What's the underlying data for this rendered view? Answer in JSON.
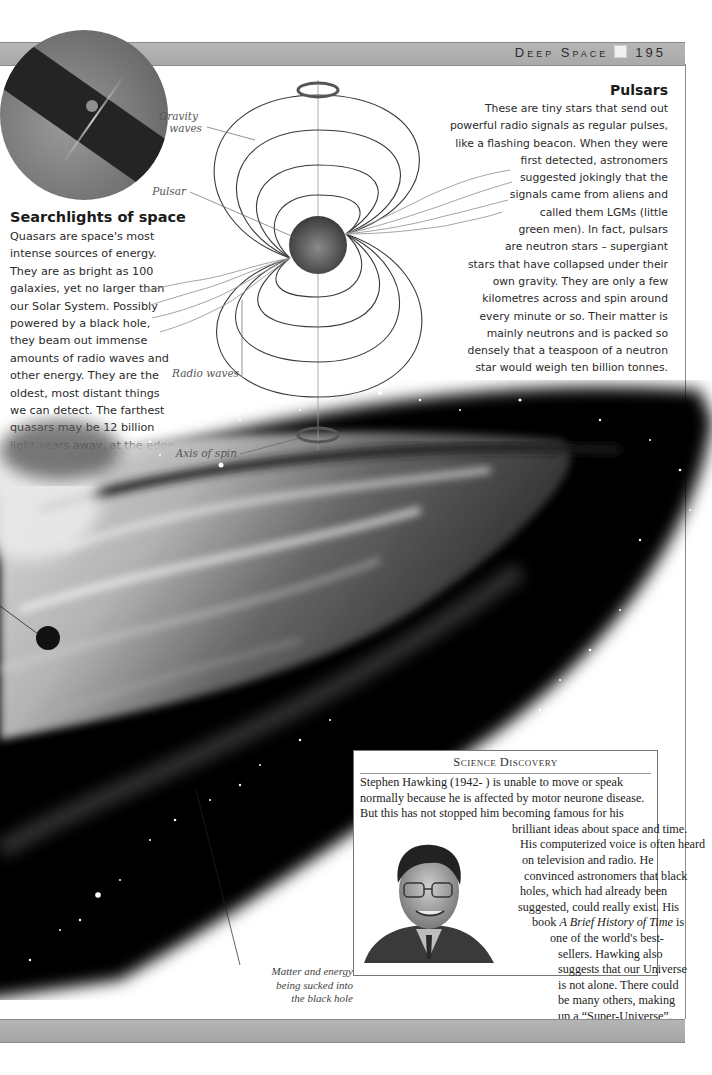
{
  "header": {
    "section": "Deep Space",
    "page_number": "195",
    "page_icon": "square-page-icon"
  },
  "searchlights": {
    "title": "Searchlights of space",
    "body_lines": [
      "Quasars are space's most",
      "intense sources of energy.",
      "They are as bright as 100",
      "galaxies, yet no larger than",
      "our Solar System. Possibly",
      "powered by a black hole,",
      "they beam out immense",
      "amounts of radio waves and",
      "other energy. They are the",
      "oldest, most distant things",
      "we can detect. The farthest",
      "quasars may be 12 billion",
      "light-years away, at the edge",
      "of space, time and the",
      "Universe."
    ]
  },
  "pulsars": {
    "title": "Pulsars",
    "body_lines": [
      "These are tiny stars that send out",
      "powerful radio signals as regular pulses,",
      "like a flashing beacon. When they were",
      "first detected, astronomers",
      "suggested jokingly that the",
      "signals came from aliens and",
      "called them LGMs (little",
      "green men). In fact, pulsars",
      "are neutron stars – supergiant",
      "stars that have collapsed under their",
      "own gravity. They are only a few",
      "kilometres across and spin around",
      "every minute or so. Their matter is",
      "mainly neutrons and is packed so",
      "densely that a teaspoon of a neutron",
      "star would weigh ten billion tonnes."
    ]
  },
  "diagram": {
    "labels": {
      "gravity_waves_1": "Gravity",
      "gravity_waves_2": "waves",
      "pulsar": "Pulsar",
      "radio_waves": "Radio waves",
      "axis_of_spin": "Axis of spin"
    }
  },
  "illustration": {
    "caption_lines": [
      "Matter and energy",
      "being sucked into",
      "the black hole"
    ]
  },
  "science_discovery": {
    "title": "Science Discovery",
    "lines": [
      {
        "text": "Stephen Hawking (1942- ) is unable to move or speak",
        "indent": 6
      },
      {
        "text": "normally because he is affected by motor neurone disease.",
        "indent": 6
      },
      {
        "text": "But this has not stopped him becoming famous for his",
        "indent": 6
      },
      {
        "text": "brilliant ideas about space and time.",
        "indent": 158
      },
      {
        "text": "His computerized voice is often heard",
        "indent": 166
      },
      {
        "text": "on television and radio. He",
        "indent": 168
      },
      {
        "text": "convinced astronomers that black",
        "indent": 170
      },
      {
        "text": "holes, which had already been",
        "indent": 166
      },
      {
        "text": "suggested, could really exist. His",
        "indent": 164
      },
      {
        "text_before": "book ",
        "italic": "A Brief History of Time",
        "text_after": " is",
        "indent": 178
      },
      {
        "text": "one of the world's best-",
        "indent": 196
      },
      {
        "text": "sellers. Hawking also",
        "indent": 204
      },
      {
        "text": "suggests that our Universe",
        "indent": 204
      },
      {
        "text": "is not alone. There could",
        "indent": 204
      },
      {
        "text": "be many others, making",
        "indent": 204
      },
      {
        "text": "up a “Super-Universe”.",
        "indent": 204
      }
    ]
  }
}
